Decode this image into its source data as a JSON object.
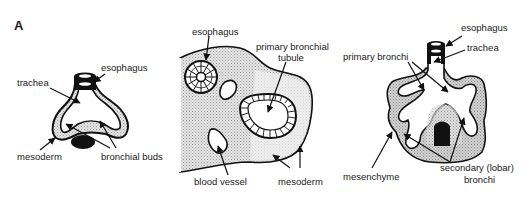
{
  "figure": {
    "panel_letter": "A",
    "colors": {
      "ink": "#111111",
      "stipple": "#d6d6d6",
      "stipple_dark": "#bdbdbd",
      "background": "#ffffff"
    },
    "panels": [
      {
        "id": "stage-1",
        "labels": {
          "esophagus": "esophagus",
          "trachea": "trachea",
          "mesoderm": "mesoderm",
          "bronchial_buds": "bronchial buds"
        }
      },
      {
        "id": "stage-2-cross-section",
        "labels": {
          "esophagus": "esophagus",
          "primary_bronchial_tubule_line1": "primary bronchial",
          "primary_bronchial_tubule_line2": "tubule",
          "blood_vessel": "blood vessel",
          "mesoderm": "mesoderm"
        }
      },
      {
        "id": "stage-3",
        "labels": {
          "esophagus": "esophagus",
          "trachea": "trachea",
          "primary_bronchi": "primary bronchi",
          "mesenchyme": "mesenchyme",
          "secondary_bronchi_line1": "secondary (lobar)",
          "secondary_bronchi_line2": "bronchi"
        }
      }
    ]
  }
}
